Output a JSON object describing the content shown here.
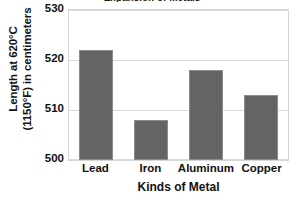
{
  "chart_data": {
    "type": "bar",
    "title": "Expansion of Metals",
    "categories": [
      "Lead",
      "Iron",
      "Aluminum",
      "Copper"
    ],
    "values": [
      522,
      508,
      518,
      513
    ],
    "xlabel": "Kinds of Metal",
    "ylabel_line1": "Length at 620°C",
    "ylabel_line2": "(1150°F) in centimeters",
    "ylim": [
      500,
      530
    ],
    "yticks": [
      500,
      510,
      520,
      530
    ],
    "ytick_labels": [
      "500",
      "510",
      "520",
      "530"
    ],
    "grid": true,
    "legend": "none",
    "bar_color": "#646464",
    "plot_background": "#ffffff",
    "gridline_color": "#dcdcdc",
    "text_color": "#111111"
  },
  "axes": {
    "y_title_line1": "Length at 620°C",
    "y_title_line2": "(1150°F) in centimeters",
    "x_title": "Kinds of Metal"
  }
}
